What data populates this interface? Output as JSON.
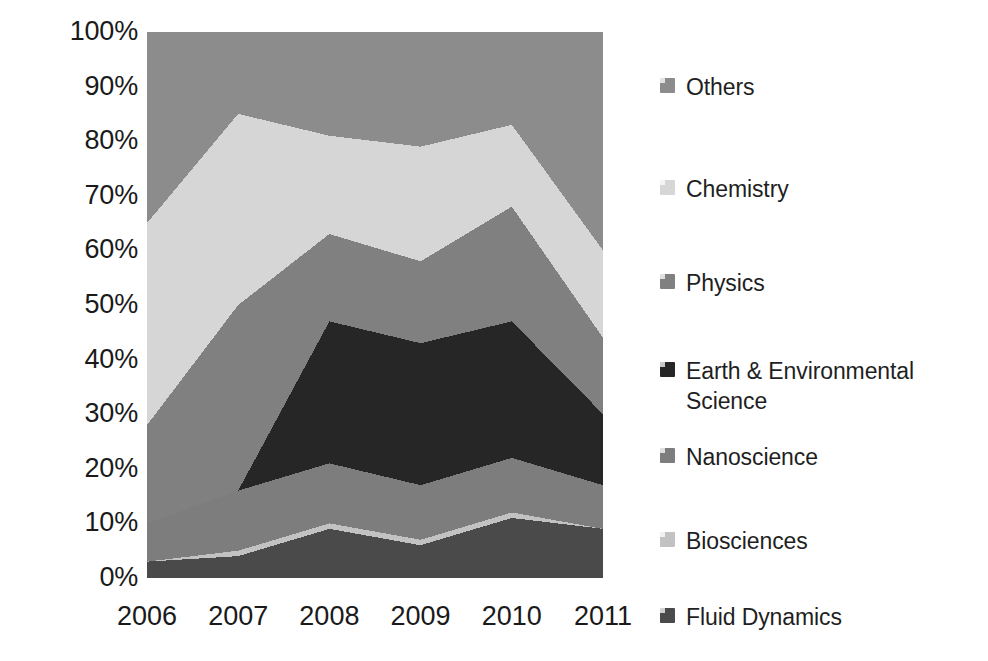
{
  "chart_data": {
    "type": "area",
    "title": "",
    "subtitle": "",
    "xlabel": "",
    "ylabel": "",
    "stacked": true,
    "normalized_100pct": true,
    "grid": false,
    "legend_position": "right",
    "categories": [
      "2006",
      "2007",
      "2008",
      "2009",
      "2010",
      "2011"
    ],
    "x": [
      2006,
      2007,
      2008,
      2009,
      2010,
      2011
    ],
    "ylim": [
      0,
      100
    ],
    "ytick_labels": [
      "100%",
      "90%",
      "80%",
      "70%",
      "60%",
      "50%",
      "40%",
      "30%",
      "20%",
      "10%",
      "0%"
    ],
    "ytick_values": [
      100,
      90,
      80,
      70,
      60,
      50,
      40,
      30,
      20,
      10,
      0
    ],
    "series": [
      {
        "name": "Fluid Dynamics",
        "color": "#4a4a4a",
        "values": [
          3,
          4,
          9,
          6,
          11,
          9
        ],
        "cumulative": [
          3,
          4,
          9,
          6,
          11,
          9
        ]
      },
      {
        "name": "Biosciences",
        "color": "#c2c2c2",
        "values": [
          0,
          1,
          1,
          1,
          1,
          0
        ],
        "cumulative": [
          3,
          5,
          10,
          7,
          12,
          9
        ]
      },
      {
        "name": "Nanoscience",
        "color": "#7d7d7d",
        "values": [
          7,
          11,
          11,
          10,
          10,
          8
        ],
        "cumulative": [
          10,
          16,
          21,
          17,
          22,
          17
        ]
      },
      {
        "name": "Earth & Environmental Science",
        "color": "#262626",
        "values": [
          0,
          0,
          26,
          26,
          25,
          13
        ],
        "cumulative": [
          10,
          16,
          47,
          43,
          47,
          30
        ]
      },
      {
        "name": "Physics",
        "color": "#808080",
        "values": [
          18,
          34,
          16,
          15,
          21,
          14
        ],
        "cumulative": [
          28,
          50,
          63,
          58,
          68,
          44
        ]
      },
      {
        "name": "Chemistry",
        "color": "#d6d6d6",
        "values": [
          37,
          35,
          18,
          21,
          15,
          16
        ],
        "cumulative": [
          65,
          85,
          81,
          79,
          83,
          60
        ]
      },
      {
        "name": "Others",
        "color": "#8c8c8c",
        "values": [
          35,
          15,
          19,
          21,
          17,
          18
        ],
        "cumulative": [
          100,
          100,
          100,
          100,
          100,
          100
        ]
      }
    ]
  },
  "legend": {
    "items": [
      {
        "label": "Others",
        "swatch_color": "#8c8c8c",
        "icon": "legend-swatch-icon"
      },
      {
        "label": "Chemistry",
        "swatch_color": "#d6d6d6",
        "icon": "legend-swatch-icon"
      },
      {
        "label": "Physics",
        "swatch_color": "#808080",
        "icon": "legend-swatch-icon"
      },
      {
        "label": "Earth & Environmental Science",
        "swatch_color": "#262626",
        "icon": "legend-swatch-icon"
      },
      {
        "label": "Nanoscience",
        "swatch_color": "#7d7d7d",
        "icon": "legend-swatch-icon"
      },
      {
        "label": "Biosciences",
        "swatch_color": "#c2c2c2",
        "icon": "legend-swatch-icon"
      },
      {
        "label": "Fluid Dynamics",
        "swatch_color": "#4a4a4a",
        "icon": "legend-swatch-icon"
      }
    ]
  },
  "colors": {
    "background": "#ffffff",
    "text": "#1f1f1f",
    "axis_text": "#1a1a1a"
  }
}
